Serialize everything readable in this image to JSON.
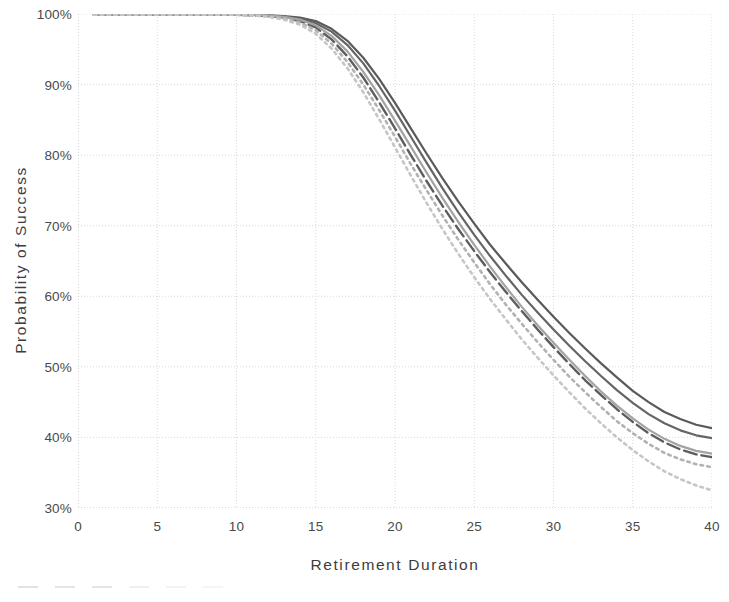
{
  "chart_data": {
    "type": "line",
    "title": "",
    "xlabel": "Retirement Duration",
    "ylabel": "Probability of Success",
    "xlim": [
      0,
      40
    ],
    "ylim": [
      30,
      100
    ],
    "xticks": [
      0,
      5,
      10,
      15,
      20,
      25,
      30,
      35,
      40
    ],
    "xtick_labels": [
      "0",
      "5",
      "10",
      "15",
      "20",
      "25",
      "30",
      "35",
      "40"
    ],
    "yticks": [
      30,
      40,
      50,
      60,
      70,
      80,
      90,
      100
    ],
    "ytick_labels": [
      "30%",
      "40%",
      "50%",
      "60%",
      "70%",
      "80%",
      "90%",
      "100%"
    ],
    "grid": true,
    "grid_style": "dotted",
    "legend_position": "bottom",
    "legend_visible": "clipped",
    "x": [
      1,
      2,
      3,
      4,
      5,
      6,
      7,
      8,
      9,
      10,
      11,
      12,
      13,
      14,
      15,
      16,
      17,
      18,
      19,
      20,
      21,
      22,
      23,
      24,
      25,
      26,
      27,
      28,
      29,
      30,
      31,
      32,
      33,
      34,
      35,
      36,
      37,
      38,
      39,
      40
    ],
    "series": [
      {
        "name": "Series 1",
        "style": "solid",
        "color": "#5a5a5a",
        "width": 2.2,
        "values": [
          99.9,
          99.9,
          99.9,
          99.9,
          99.9,
          99.9,
          99.9,
          99.9,
          99.9,
          99.9,
          99.9,
          99.8,
          99.7,
          99.5,
          99.0,
          97.9,
          96.2,
          93.8,
          90.8,
          87.4,
          83.8,
          80.2,
          76.7,
          73.4,
          70.3,
          67.3,
          64.6,
          62.0,
          59.5,
          57.1,
          54.8,
          52.6,
          50.5,
          48.5,
          46.6,
          45.0,
          43.6,
          42.6,
          41.8,
          41.3
        ]
      },
      {
        "name": "Series 2",
        "style": "solid",
        "color": "#656565",
        "width": 2.2,
        "values": [
          99.9,
          99.9,
          99.9,
          99.9,
          99.9,
          99.9,
          99.9,
          99.9,
          99.9,
          99.9,
          99.9,
          99.8,
          99.6,
          99.3,
          98.7,
          97.5,
          95.6,
          93.0,
          89.8,
          86.3,
          82.6,
          78.9,
          75.3,
          71.9,
          68.7,
          65.7,
          62.9,
          60.2,
          57.7,
          55.3,
          53.0,
          50.8,
          48.7,
          46.7,
          44.9,
          43.3,
          42.0,
          41.0,
          40.3,
          39.9
        ]
      },
      {
        "name": "Series 3",
        "style": "dashed",
        "color": "#5d5d5d",
        "width": 2.4,
        "values": [
          99.9,
          99.9,
          99.9,
          99.9,
          99.9,
          99.9,
          99.9,
          99.9,
          99.9,
          99.9,
          99.8,
          99.7,
          99.5,
          99.0,
          98.1,
          96.4,
          94.0,
          91.0,
          87.5,
          83.8,
          80.0,
          76.3,
          72.8,
          69.5,
          66.4,
          63.4,
          60.6,
          57.9,
          55.3,
          52.8,
          50.4,
          48.1,
          46.0,
          44.0,
          42.2,
          40.6,
          39.3,
          38.3,
          37.6,
          37.2
        ]
      },
      {
        "name": "Series 4",
        "style": "solid",
        "color": "#a3a3a3",
        "width": 2.2,
        "values": [
          99.9,
          99.9,
          99.9,
          99.9,
          99.9,
          99.9,
          99.9,
          99.9,
          99.9,
          99.9,
          99.9,
          99.8,
          99.6,
          99.2,
          98.4,
          96.9,
          94.7,
          91.8,
          88.5,
          84.9,
          81.2,
          77.5,
          73.9,
          70.5,
          67.3,
          64.2,
          61.3,
          58.5,
          55.9,
          53.4,
          51.0,
          48.7,
          46.5,
          44.5,
          42.7,
          41.1,
          39.8,
          38.8,
          38.1,
          37.7
        ]
      },
      {
        "name": "Series 5",
        "style": "dotted",
        "color": "#b2b2b2",
        "width": 2.6,
        "values": [
          99.9,
          99.9,
          99.9,
          99.9,
          99.9,
          99.9,
          99.9,
          99.9,
          99.9,
          99.9,
          99.8,
          99.7,
          99.4,
          98.8,
          97.7,
          95.8,
          93.2,
          90.0,
          86.4,
          82.6,
          78.7,
          75.0,
          71.4,
          68.0,
          64.8,
          61.7,
          58.8,
          56.1,
          53.5,
          51.0,
          48.6,
          46.4,
          44.3,
          42.3,
          40.6,
          39.1,
          37.8,
          36.9,
          36.2,
          35.8
        ]
      },
      {
        "name": "Series 6",
        "style": "dotted",
        "color": "#c6c6c6",
        "width": 2.6,
        "values": [
          99.9,
          99.9,
          99.9,
          99.9,
          99.9,
          99.9,
          99.9,
          99.9,
          99.9,
          99.9,
          99.8,
          99.6,
          99.2,
          98.5,
          97.2,
          95.1,
          92.3,
          88.9,
          85.1,
          81.1,
          77.1,
          73.2,
          69.5,
          66.0,
          62.7,
          59.6,
          56.7,
          53.9,
          51.3,
          48.8,
          46.4,
          44.1,
          42.0,
          40.0,
          38.2,
          36.6,
          35.2,
          34.1,
          33.2,
          32.5
        ]
      }
    ]
  },
  "legend": {
    "items": [
      {
        "label": ""
      },
      {
        "label": ""
      },
      {
        "label": ""
      },
      {
        "label": ""
      },
      {
        "label": ""
      },
      {
        "label": ""
      }
    ]
  },
  "colors": {
    "axis": "#b9b9b9",
    "grid": "#d9d9d9",
    "text": "#3d3d3d",
    "tick_text": "#4a4a4a",
    "background": "#ffffff"
  }
}
